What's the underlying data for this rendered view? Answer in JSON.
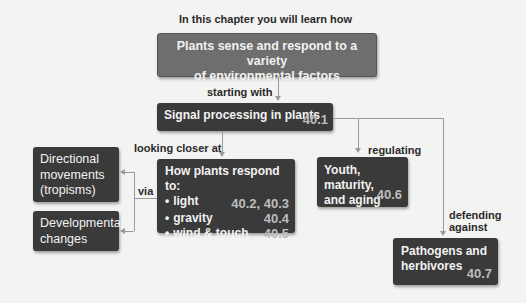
{
  "header": {
    "intro": "In this chapter you will learn how"
  },
  "top_box": {
    "line1": "Plants sense and respond to a variety",
    "line2": "of environmental factors"
  },
  "connectors": {
    "starting_with": "starting with",
    "looking_closer_at": "looking closer at",
    "via": "via",
    "regulating": "regulating",
    "defending_against_1": "defending",
    "defending_against_2": "against"
  },
  "signal_box": {
    "label": "Signal processing in plants",
    "section": "40.1"
  },
  "respond_box": {
    "title": "How plants respond to:",
    "items": [
      {
        "bullet": "•",
        "label": "light",
        "sections": "40.2, 40.3"
      },
      {
        "bullet": "•",
        "label": "gravity",
        "sections": "40.4"
      },
      {
        "bullet": "•",
        "label": "wind & touch",
        "sections": "40.5"
      }
    ]
  },
  "directional_box": {
    "line1": "Directional",
    "line2": "movements",
    "line3": "(tropisms)"
  },
  "developmental_box": {
    "line1": "Developmental",
    "line2": "changes"
  },
  "youth_box": {
    "line1": "Youth, maturity,",
    "line2": "and aging",
    "section": "40.6"
  },
  "pathogens_box": {
    "line1": "Pathogens and",
    "line2": "herbivores",
    "section": "40.7"
  },
  "colors": {
    "box_dark": "#3a3a3a",
    "box_top": "#6e6e6e",
    "section_num": "#bdbdbd",
    "connector": "#9a9a9a",
    "background": "#f3f3f1"
  }
}
